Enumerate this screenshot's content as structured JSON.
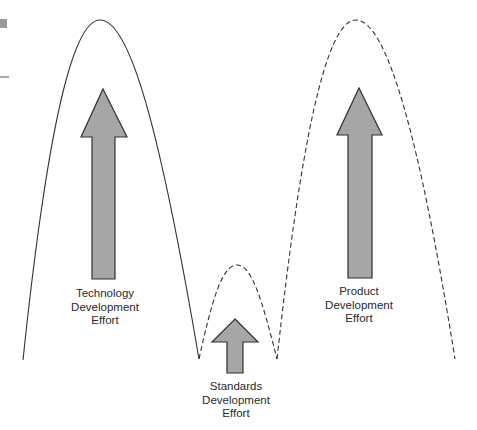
{
  "diagram": {
    "colors": {
      "line": "#333333",
      "arrow_fill": "#a6a6a6",
      "arrow_stroke": "#2f2f2f",
      "marker": "#9a9a9a",
      "text": "#2a2a2a"
    },
    "curves": [
      {
        "name": "technology-curve",
        "style": "solid"
      },
      {
        "name": "standards-curve",
        "style": "dashed"
      },
      {
        "name": "product-curve",
        "style": "dashed"
      }
    ],
    "labels": {
      "technology": {
        "line1": "Technology",
        "line2": "Development",
        "line3": "Effort"
      },
      "standards": {
        "line1": "Standards",
        "line2": "Development",
        "line3": "Effort"
      },
      "product": {
        "line1": "Product",
        "line2": "Development",
        "line3": "Effort"
      }
    }
  }
}
